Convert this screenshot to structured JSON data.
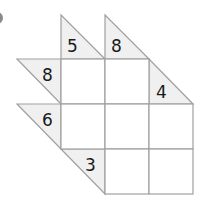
{
  "puzzle": {
    "type": "kakuro-triangle",
    "grid": {
      "origin_x": 17,
      "origin_y": 15,
      "cell_size": 44,
      "rows": 4,
      "cols": 4
    },
    "colors": {
      "clue_fill": "#f0f0f0",
      "line": "#a0a0a0",
      "cell_fill": "#ffffff",
      "text": "#1a1a1a"
    },
    "clues": [
      {
        "id": "clue-col1-down",
        "row": 0,
        "col": 1,
        "shape": "down",
        "value": "5"
      },
      {
        "id": "clue-col2-down",
        "row": 0,
        "col": 2,
        "shape": "down",
        "value": "8"
      },
      {
        "id": "clue-row1-across",
        "row": 1,
        "col": 0,
        "shape": "across",
        "value": "8"
      },
      {
        "id": "clue-col3-down",
        "row": 1,
        "col": 3,
        "shape": "down",
        "value": "4"
      },
      {
        "id": "clue-row2-across",
        "row": 2,
        "col": 0,
        "shape": "across",
        "value": "6"
      },
      {
        "id": "clue-row3-across",
        "row": 3,
        "col": 1,
        "shape": "across",
        "value": "3"
      }
    ],
    "cells": [
      {
        "row": 1,
        "col": 1,
        "value": ""
      },
      {
        "row": 1,
        "col": 2,
        "value": ""
      },
      {
        "row": 2,
        "col": 1,
        "value": ""
      },
      {
        "row": 2,
        "col": 2,
        "value": ""
      },
      {
        "row": 2,
        "col": 3,
        "value": ""
      },
      {
        "row": 3,
        "col": 2,
        "value": ""
      },
      {
        "row": 3,
        "col": 3,
        "value": ""
      }
    ]
  }
}
